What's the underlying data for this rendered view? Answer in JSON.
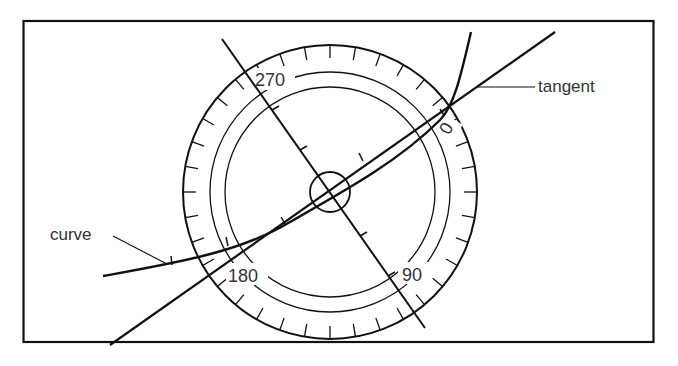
{
  "diagram": {
    "labels": {
      "curve": "curve",
      "tangent": "tangent"
    },
    "dial_labels": {
      "d0": "0",
      "d90": "90",
      "d180": "180",
      "d270": "270"
    },
    "colors": {
      "ink": "#111111",
      "background": "#ffffff"
    }
  }
}
